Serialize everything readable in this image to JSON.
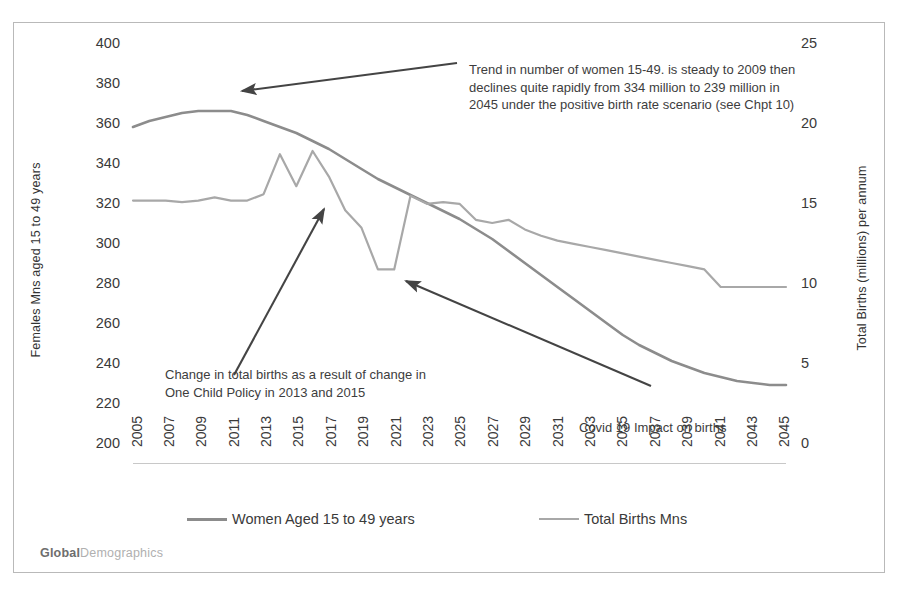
{
  "axes": {
    "y_left_title": "Females Mns aged 15 to 49 years",
    "y_right_title": "Total Births (millions) per annum",
    "y_left_ticks": [
      "400",
      "380",
      "360",
      "340",
      "320",
      "300",
      "280",
      "260",
      "240",
      "220",
      "200"
    ],
    "y_right_ticks": [
      "25",
      "20",
      "15",
      "10",
      "5",
      "0"
    ],
    "x_ticks": [
      "2005",
      "2007",
      "2009",
      "2011",
      "2013",
      "2015",
      "2017",
      "2019",
      "2021",
      "2023",
      "2025",
      "2027",
      "2029",
      "2031",
      "2033",
      "2035",
      "2037",
      "2039",
      "2041",
      "2043",
      "2045"
    ]
  },
  "annotations": {
    "women_trend": "Trend in number of women 15-49. is steady to 2009 then declines quite rapidly from 334 million  to 239 million in 2045 under the positive birth rate scenario (see Chpt 10)",
    "one_child_policy": "Change in total births as a result of change in One Child Policy in 2013 and 2015",
    "covid": "Covid 19 Impact on births"
  },
  "legend": {
    "women_label": "Women Aged 15 to 49 years",
    "births_label": "Total Births Mns"
  },
  "brand": {
    "bold": "Global",
    "light": "Demographics"
  },
  "colors": {
    "women_line": "#8c8c8c",
    "births_line": "#a8a8a8",
    "arrow": "#444444",
    "border": "#b9b9b9",
    "text": "#3b3b3b"
  },
  "chart_data": {
    "type": "line",
    "title": "",
    "xlabel": "",
    "ylabel": "Females Mns aged 15 to 49 years",
    "y2label": "Total Births (millions) per annum",
    "ylim": [
      200,
      400
    ],
    "y2lim": [
      0,
      25
    ],
    "grid": false,
    "legend_position": "bottom",
    "x": [
      2005,
      2006,
      2007,
      2008,
      2009,
      2010,
      2011,
      2012,
      2013,
      2014,
      2015,
      2016,
      2017,
      2018,
      2019,
      2020,
      2021,
      2022,
      2023,
      2024,
      2025,
      2026,
      2027,
      2028,
      2029,
      2030,
      2031,
      2032,
      2033,
      2034,
      2035,
      2036,
      2037,
      2038,
      2039,
      2040,
      2041,
      2042,
      2043,
      2044,
      2045
    ],
    "series": [
      {
        "name": "Women Aged 15 to 49 years",
        "axis": "left",
        "unit": "millions",
        "values": [
          368,
          371,
          373,
          375,
          376,
          376,
          376,
          374,
          371,
          368,
          365,
          361,
          357,
          352,
          347,
          342,
          338,
          334,
          330,
          326,
          322,
          317,
          312,
          306,
          300,
          294,
          288,
          282,
          276,
          270,
          264,
          259,
          255,
          251,
          248,
          245,
          243,
          241,
          240,
          239,
          239
        ]
      },
      {
        "name": "Total Births Mns",
        "axis": "right",
        "unit": "millions per annum",
        "values": [
          16.4,
          16.4,
          16.4,
          16.3,
          16.4,
          16.6,
          16.4,
          16.4,
          16.8,
          19.3,
          17.3,
          19.5,
          17.9,
          15.8,
          14.7,
          12.1,
          12.1,
          16.7,
          16.2,
          16.3,
          16.2,
          15.2,
          15.0,
          15.2,
          14.6,
          14.2,
          13.9,
          13.7,
          13.5,
          13.3,
          13.1,
          12.9,
          12.7,
          12.5,
          12.3,
          12.1,
          11.0,
          11.0,
          11.0,
          11.0,
          11.0
        ]
      }
    ],
    "notes": {
      "women_start": 368,
      "women_end": 239,
      "births_peak_2016": 19.5,
      "births_covid_trough": 12.1,
      "crossover_year": 2030
    }
  }
}
